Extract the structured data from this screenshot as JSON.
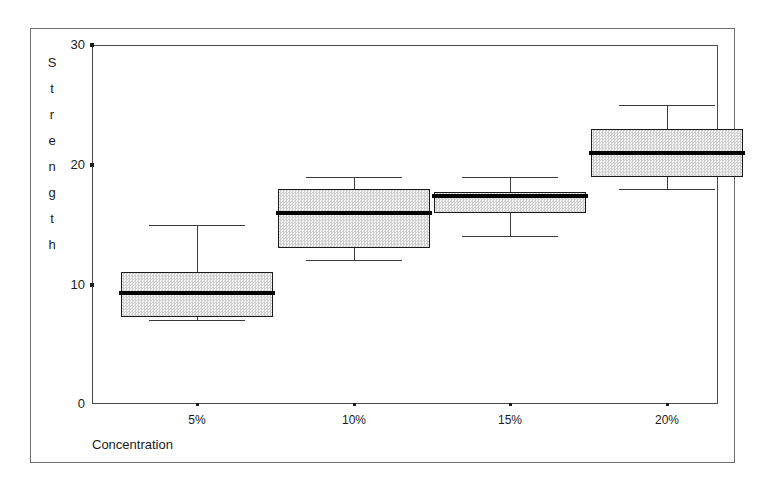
{
  "chart_data": {
    "type": "box",
    "title": "",
    "xlabel": "Concentration",
    "ylabel": "Strength",
    "categories": [
      "5%",
      "10%",
      "15%",
      "20%"
    ],
    "ylim": [
      0,
      30
    ],
    "yticks": [
      0,
      10,
      20,
      30
    ],
    "grid": false,
    "legend": "none",
    "boxes": [
      {
        "category": "5%",
        "whisker_low": 7,
        "q1": 7.3,
        "median": 9.3,
        "q3": 11,
        "whisker_high": 15
      },
      {
        "category": "10%",
        "whisker_low": 12,
        "q1": 13,
        "median": 16,
        "q3": 18,
        "whisker_high": 19
      },
      {
        "category": "15%",
        "whisker_low": 14,
        "q1": 16,
        "median": 17.4,
        "q3": 17.7,
        "whisker_high": 19
      },
      {
        "category": "20%",
        "whisker_low": 18,
        "q1": 19,
        "median": 21,
        "q3": 23,
        "whisker_high": 25
      }
    ],
    "style": {
      "box_fill": "#e8e8e8",
      "box_edge": "#1a1a1a",
      "median_color": "#000000",
      "whisker_color": "#3a3a3a",
      "axis_color": "#4a4a4a",
      "frame_color": "#6e6e6e",
      "background": "#ffffff"
    }
  },
  "axes": {
    "y_title_letters": [
      "S",
      "t",
      "r",
      "e",
      "n",
      "g",
      "t",
      "h"
    ],
    "y_tick_labels": [
      "30",
      "20",
      "10",
      "0"
    ],
    "x_tick_labels": [
      "5%",
      "10%",
      "15%",
      "20%"
    ],
    "x_title": "Concentration"
  }
}
